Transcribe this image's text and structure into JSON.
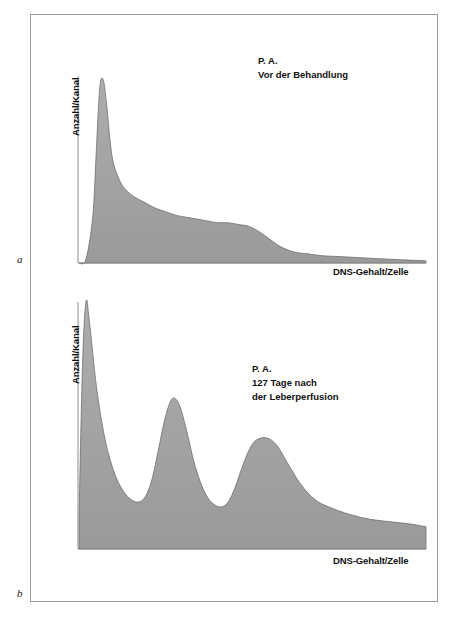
{
  "figure": {
    "panels": [
      {
        "letter": "a",
        "y_axis_label": "Anzahl/Kanal",
        "x_axis_label": "DNS-Gehalt/Zelle",
        "annotation_lines": [
          "P. A.",
          "Vor der Behandlung"
        ]
      },
      {
        "letter": "b",
        "y_axis_label": "Anzahl/Kanal",
        "x_axis_label": "DNS-Gehalt/Zelle",
        "annotation_lines": [
          "P. A.",
          "127 Tage nach",
          "der Leberperfusion"
        ]
      }
    ],
    "colors": {
      "curve_fill": "#a2a2a2",
      "curve_stroke": "#6f6f6f",
      "axis": "#8d8d8d",
      "frame": "#9a9a9a",
      "text": "#101010",
      "background": "#ffffff"
    }
  },
  "chart_data": [
    {
      "type": "area",
      "panel": "a",
      "title": "P. A. Vor der Behandlung",
      "subtitle": "",
      "xlabel": "DNS-Gehalt/Zelle",
      "ylabel": "Anzahl/Kanal",
      "xlim": [
        0,
        100
      ],
      "ylim": [
        0,
        100
      ],
      "grid": false,
      "legend": "none",
      "axis_ticks": "none",
      "description": "DNA histogram before treatment: single dominant narrow G0/G1 peak near the origin with a long decaying right tail and a small shoulder at intermediate DNA content.",
      "x": [
        0,
        2,
        4,
        5,
        6,
        7,
        8,
        9,
        10,
        12,
        14,
        16,
        18,
        20,
        22,
        25,
        28,
        31,
        34,
        37,
        40,
        43,
        46,
        49,
        52,
        55,
        58,
        62,
        66,
        70,
        75,
        80,
        85,
        90,
        95,
        100
      ],
      "values": [
        0,
        2,
        26,
        62,
        96,
        100,
        86,
        66,
        54,
        44,
        39,
        36,
        34,
        32,
        30,
        28,
        26,
        25,
        24,
        23,
        22,
        22,
        21,
        20,
        17,
        13,
        9,
        6,
        5,
        4,
        3.5,
        3,
        2.5,
        2,
        1.6,
        1.2
      ],
      "peaks": [
        {
          "name": "G0/G1 peak",
          "x": 7,
          "height": 100
        },
        {
          "name": "shoulder",
          "x": 41,
          "height": 22
        }
      ]
    },
    {
      "type": "area",
      "panel": "b",
      "title": "P. A. 127 Tage nach der Leberperfusion",
      "subtitle": "",
      "xlabel": "DNS-Gehalt/Zelle",
      "ylabel": "Anzahl/Kanal",
      "xlim": [
        0,
        100
      ],
      "ylim": [
        0,
        100
      ],
      "grid": false,
      "legend": "none",
      "axis_ticks": "none",
      "description": "DNA histogram 127 days after liver perfusion: very tall narrow peak at the origin plus two broad resolved peaks at intermediate and higher DNA content, then a long flat tail.",
      "x": [
        0,
        1,
        2,
        3,
        5,
        7,
        9,
        11,
        13,
        15,
        17,
        19,
        21,
        23,
        25,
        27,
        29,
        31,
        33,
        35,
        37,
        39,
        41,
        43,
        45,
        47,
        49,
        51,
        54,
        57,
        60,
        64,
        68,
        72,
        78,
        84,
        90,
        96,
        100
      ],
      "values": [
        12,
        74,
        100,
        92,
        66,
        48,
        36,
        28,
        23,
        20,
        19,
        21,
        28,
        41,
        54,
        61,
        58,
        48,
        36,
        27,
        21,
        18,
        17,
        19,
        25,
        33,
        40,
        44,
        45,
        42,
        35,
        26,
        20,
        17,
        14,
        12,
        11,
        10,
        9
      ],
      "peaks": [
        {
          "name": "G0/G1 peak",
          "x": 2,
          "height": 100
        },
        {
          "name": "second peak",
          "x": 27,
          "height": 61
        },
        {
          "name": "third peak",
          "x": 54,
          "height": 45
        }
      ]
    }
  ]
}
